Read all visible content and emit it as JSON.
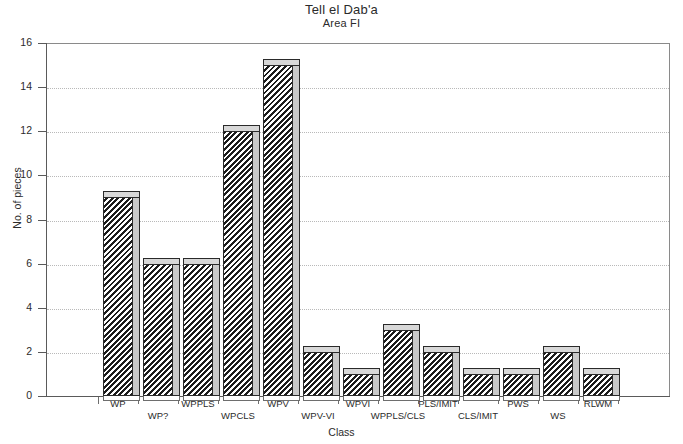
{
  "chart_data": {
    "type": "bar",
    "title": "Tell el Dab'a",
    "subtitle": "Area FI",
    "xlabel": "Class",
    "ylabel": "No. of pieces",
    "ylim": [
      0,
      16
    ],
    "ytick_values": [
      0,
      2,
      4,
      6,
      8,
      10,
      12,
      14,
      16
    ],
    "ytick_labels": [
      "0",
      "2",
      "4",
      "6",
      "8",
      "10",
      "12",
      "14",
      "16"
    ],
    "grid": true,
    "legend": "none",
    "categories": [
      "WP",
      "WP?",
      "WPPLS",
      "WPCLS",
      "WPV",
      "WPV-VI",
      "WPVI",
      "WPPLS/CLS",
      "PLS/IMIT",
      "CLS/IMIT",
      "PWS",
      "WS",
      "RLWM"
    ],
    "values": [
      9,
      6,
      6,
      12,
      15,
      2,
      1,
      3,
      2,
      1,
      1,
      2,
      1
    ],
    "series": [
      {
        "name": "No. of pieces",
        "values": [
          9,
          6,
          6,
          12,
          15,
          2,
          1,
          3,
          2,
          1,
          1,
          2,
          1
        ]
      }
    ],
    "category_label_rows": [
      {
        "row": 1,
        "labels": [
          "WP",
          "WPPLS",
          "WPV",
          "WPVI",
          "PLS/IMIT",
          "PWS",
          "RLWM"
        ]
      },
      {
        "row": 2,
        "labels": [
          "WP?",
          "WPCLS",
          "WPV-VI",
          "WPPLS/CLS",
          "CLS/IMIT",
          "WS"
        ]
      }
    ]
  },
  "style": {
    "bar_fill": "#1c1c1c",
    "bar_side": "#c9c9c9",
    "bar_top": "#d8d8d8",
    "axis_color": "#5a5a5a",
    "grid_color": "#b9b9b9",
    "background": "#ffffff"
  }
}
